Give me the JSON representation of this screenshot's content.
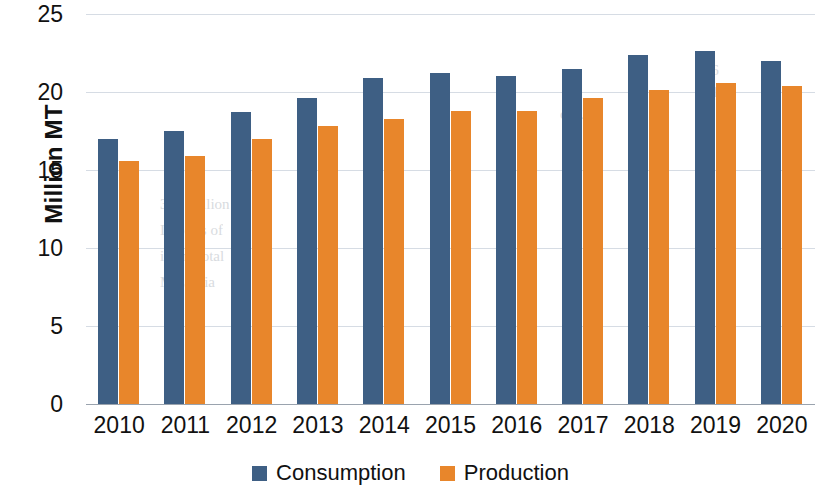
{
  "chart_data": {
    "type": "bar",
    "title": "",
    "xlabel": "",
    "ylabel": "Million MT",
    "ylim": [
      0,
      25
    ],
    "ytick_step": 5,
    "yticks": [
      "25",
      "20",
      "15",
      "10",
      "5",
      "0"
    ],
    "grid": true,
    "legend_position": "bottom-center",
    "categories": [
      "2010",
      "2011",
      "2012",
      "2013",
      "2014",
      "2015",
      "2016",
      "2017",
      "2018",
      "2019",
      "2020"
    ],
    "series": [
      {
        "name": "Consumption",
        "color": "#3e5f84",
        "values": [
          17.0,
          17.5,
          18.7,
          19.6,
          20.9,
          21.2,
          21.0,
          21.5,
          22.4,
          22.6,
          22.0
        ]
      },
      {
        "name": "Production",
        "color": "#e8862b",
        "values": [
          15.6,
          15.9,
          17.0,
          17.8,
          18.3,
          18.8,
          18.8,
          19.6,
          20.1,
          20.6,
          20.4
        ]
      }
    ]
  },
  "legend": {
    "items": [
      {
        "label": "Consumption",
        "color": "#3e5f84",
        "swatch_name": "consumption-swatch"
      },
      {
        "label": "Production",
        "color": "#e8862b",
        "swatch_name": "production-swatch"
      }
    ]
  },
  "bleed_text": {
    "lines": [
      "1.6",
      "2.1",
      "of ...",
      "350 million",
      "Imports of",
      "in the total",
      "Malaysia"
    ]
  }
}
